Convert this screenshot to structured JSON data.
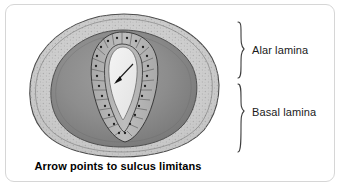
{
  "figure": {
    "caption": "Arrow points to sulcus limitans",
    "annotations": [
      {
        "id": "alar",
        "label": "Alar lamina",
        "brace": "upper"
      },
      {
        "id": "basal",
        "label": "Basal lamina",
        "brace": "lower"
      }
    ],
    "pointer": {
      "name": "arrow",
      "points_to": "sulcus limitans"
    },
    "structures": [
      {
        "name": "marginal-zone",
        "description": "outer stippled layer"
      },
      {
        "name": "mantle-zone",
        "description": "inner dark gray layer"
      },
      {
        "name": "ependymal-layer",
        "description": "columnar cells with nuclei lining the canal"
      },
      {
        "name": "central-canal",
        "description": "pale slit-shaped lumen"
      }
    ]
  },
  "colors": {
    "card_background": "#ffffff",
    "card_border": "#d6d6d6",
    "marginal_zone": "#cfcfcf",
    "mantle_zone": "#8e8e8e",
    "ependymal_layer": "#b4b4b4",
    "canal_lumen": "#ededed",
    "outline": "#3a3a3a",
    "text": "#1a1a1a",
    "caption_text": "#000000"
  }
}
